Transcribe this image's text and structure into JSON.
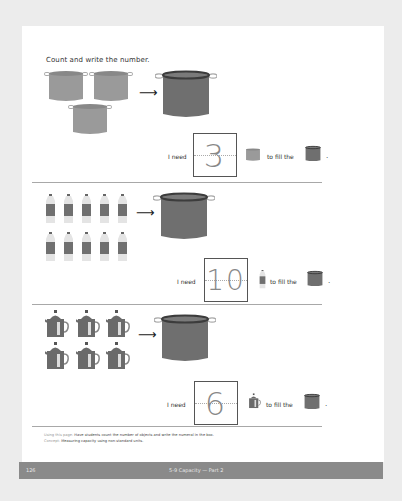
{
  "instruction": "Count and write the number.",
  "sections": [
    {
      "objects": "small pots",
      "count_shown": 3,
      "target": "large pot",
      "need_label": "I need",
      "answer": "3",
      "fill_label": "to fill the",
      "end_punct": "."
    },
    {
      "objects": "water bottles",
      "count_shown": 10,
      "target": "large pot",
      "need_label": "I need",
      "answer": "10",
      "fill_label": "to fill the",
      "end_punct": "."
    },
    {
      "objects": "kettles",
      "count_shown": 6,
      "target": "large pot",
      "need_label": "I need",
      "answer": "6",
      "fill_label": "to fill the",
      "end_punct": "."
    }
  ],
  "notes": {
    "using_label": "Using this page:",
    "using_text": "Have students count the number of objects and write the numeral in the box.",
    "concept_label": "Concept:",
    "concept_text": "Measuring capacity using non-standard units."
  },
  "footer": {
    "page_number": "126",
    "title": "5-9  Capacity — Part 2"
  },
  "colors": {
    "background": "#ececec",
    "page": "#ffffff",
    "small_pot": "#9a9a9a",
    "large_pot": "#6f6f6f",
    "bottle_label": "#707070",
    "kettle": "#6a6a6a",
    "footer_bar": "#8a8a8a"
  }
}
